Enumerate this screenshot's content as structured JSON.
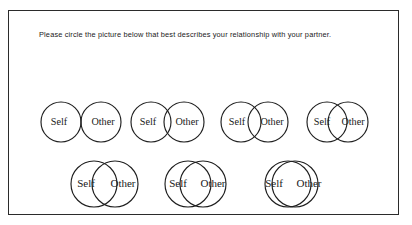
{
  "instrument": {
    "name": "Inclusion of Other in the Self Scale",
    "instruction": "Please circle the picture below that best describes your relationship with your partner."
  },
  "labels": {
    "self": "Self",
    "other": "Other"
  },
  "items": [
    {
      "number": 1,
      "row": 1,
      "overlap": "none",
      "left": 28,
      "top": 87,
      "radius": 20,
      "gap": 40,
      "label_offset": 12
    },
    {
      "number": 2,
      "row": 1,
      "overlap": "slight",
      "left": 118,
      "top": 87,
      "radius": 20,
      "gap": 33,
      "label_offset": 13
    },
    {
      "number": 3,
      "row": 1,
      "overlap": "small",
      "left": 208,
      "top": 87,
      "radius": 20,
      "gap": 27,
      "label_offset": 14
    },
    {
      "number": 4,
      "row": 1,
      "overlap": "moderate",
      "left": 294,
      "top": 87,
      "radius": 20,
      "gap": 21,
      "label_offset": 15
    },
    {
      "number": 5,
      "row": 2,
      "overlap": "large",
      "left": 58,
      "top": 146,
      "radius": 23,
      "gap": 21,
      "label_offset": 18
    },
    {
      "number": 6,
      "row": 2,
      "overlap": "very-large",
      "left": 152,
      "top": 146,
      "radius": 23,
      "gap": 15,
      "label_offset": 20
    },
    {
      "number": 7,
      "row": 2,
      "overlap": "near-complete",
      "left": 252,
      "top": 146,
      "radius": 23,
      "gap": 7,
      "label_offset": 24
    }
  ]
}
